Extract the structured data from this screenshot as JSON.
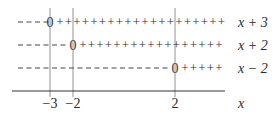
{
  "diagram": {
    "type": "sign-chart",
    "critical_points": [
      {
        "label": "−3",
        "value": -3,
        "x": 50
      },
      {
        "label": "−2",
        "value": -2,
        "x": 73
      },
      {
        "label": "2",
        "value": 2,
        "x": 175
      }
    ],
    "axis_label": "x",
    "rows": [
      {
        "factor": "x + 3",
        "zero_at": -3,
        "left_sign": "−",
        "right_sign": "+"
      },
      {
        "factor": "x + 2",
        "zero_at": -2,
        "left_sign": "−",
        "right_sign": "+"
      },
      {
        "factor": "x − 2",
        "zero_at": 2,
        "left_sign": "−",
        "right_sign": "+"
      }
    ],
    "zero_symbol": "0",
    "colors": {
      "line": "#555555",
      "text": "#2a2a2a"
    }
  }
}
